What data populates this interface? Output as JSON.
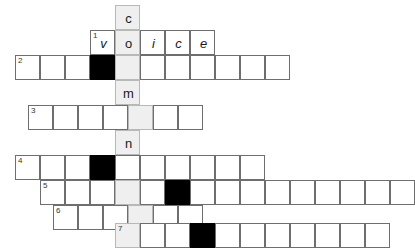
{
  "puzzle": {
    "type": "crossword",
    "cell_size": 25,
    "origin": {
      "x": 15,
      "y": 5
    },
    "colors": {
      "cell_background": "#ffffff",
      "cell_border": "#6e6e6e",
      "shaded_background": "#efefef",
      "shaded_border": "#b8b8b8",
      "block_background": "#000000",
      "letter_color": "#1a1a1a",
      "number_color": "#333333",
      "page_background": "#ffffff"
    },
    "vertical_word": {
      "column_x": 115,
      "letters": [
        "c",
        "o",
        "i",
        "m",
        "n",
        "i"
      ],
      "solved_text": "coimni"
    },
    "rows": [
      {
        "row_index": 0,
        "y": 5,
        "start_x": 115,
        "cells": [
          {
            "letter": "c",
            "shaded": true,
            "black": false,
            "number": ""
          }
        ]
      },
      {
        "row_index": 1,
        "y": 30,
        "start_x": 90,
        "cells": [
          {
            "letter": "v",
            "shaded": false,
            "black": false,
            "number": "1"
          },
          {
            "letter": "o",
            "shaded": true,
            "black": false,
            "number": ""
          },
          {
            "letter": "i",
            "shaded": false,
            "black": false,
            "number": ""
          },
          {
            "letter": "c",
            "shaded": false,
            "black": false,
            "number": ""
          },
          {
            "letter": "e",
            "shaded": false,
            "black": false,
            "number": ""
          }
        ]
      },
      {
        "row_index": 2,
        "y": 55,
        "start_x": 15,
        "cells": [
          {
            "letter": "",
            "shaded": false,
            "black": false,
            "number": "2"
          },
          {
            "letter": "",
            "shaded": false,
            "black": false,
            "number": ""
          },
          {
            "letter": "",
            "shaded": false,
            "black": false,
            "number": ""
          },
          {
            "letter": "",
            "shaded": false,
            "black": true,
            "number": ""
          },
          {
            "letter": "",
            "shaded": true,
            "black": false,
            "number": ""
          },
          {
            "letter": "",
            "shaded": false,
            "black": false,
            "number": ""
          },
          {
            "letter": "",
            "shaded": false,
            "black": false,
            "number": ""
          },
          {
            "letter": "",
            "shaded": false,
            "black": false,
            "number": ""
          },
          {
            "letter": "",
            "shaded": false,
            "black": false,
            "number": ""
          },
          {
            "letter": "",
            "shaded": false,
            "black": false,
            "number": ""
          },
          {
            "letter": "",
            "shaded": false,
            "black": false,
            "number": ""
          }
        ]
      },
      {
        "row_index": 3,
        "y": 80,
        "start_x": 115,
        "cells": [
          {
            "letter": "m",
            "shaded": true,
            "black": false,
            "number": ""
          }
        ]
      },
      {
        "row_index": 4,
        "y": 105,
        "start_x": 28,
        "cells": [
          {
            "letter": "",
            "shaded": false,
            "black": false,
            "number": "3"
          },
          {
            "letter": "",
            "shaded": false,
            "black": false,
            "number": ""
          },
          {
            "letter": "",
            "shaded": false,
            "black": false,
            "number": ""
          },
          {
            "letter": "",
            "shaded": false,
            "black": false,
            "number": ""
          },
          {
            "letter": "",
            "shaded": true,
            "black": false,
            "number": ""
          },
          {
            "letter": "",
            "shaded": false,
            "black": false,
            "number": ""
          },
          {
            "letter": "",
            "shaded": false,
            "black": false,
            "number": ""
          }
        ]
      },
      {
        "row_index": 5,
        "y": 130,
        "start_x": 115,
        "cells": [
          {
            "letter": "n",
            "shaded": true,
            "black": false,
            "number": ""
          }
        ]
      },
      {
        "row_index": 6,
        "y": 155,
        "start_x": 115,
        "cells": [
          {
            "letter": "i",
            "shaded": true,
            "black": false,
            "number": ""
          }
        ]
      },
      {
        "row_index": 7,
        "y": 155,
        "start_x": 15,
        "cells": [
          {
            "letter": "",
            "shaded": false,
            "black": false,
            "number": "4"
          },
          {
            "letter": "",
            "shaded": false,
            "black": false,
            "number": ""
          },
          {
            "letter": "",
            "shaded": false,
            "black": false,
            "number": ""
          },
          {
            "letter": "",
            "shaded": false,
            "black": true,
            "number": ""
          },
          {
            "letter": "",
            "shaded": false,
            "black": false,
            "number": "SKIP"
          },
          {
            "letter": "",
            "shaded": false,
            "black": false,
            "number": ""
          },
          {
            "letter": "",
            "shaded": false,
            "black": false,
            "number": ""
          },
          {
            "letter": "",
            "shaded": false,
            "black": false,
            "number": ""
          },
          {
            "letter": "",
            "shaded": false,
            "black": false,
            "number": ""
          },
          {
            "letter": "",
            "shaded": false,
            "black": false,
            "number": ""
          }
        ]
      },
      {
        "row_index": 8,
        "y": 180,
        "start_x": 40,
        "cells": [
          {
            "letter": "",
            "shaded": false,
            "black": false,
            "number": "5"
          },
          {
            "letter": "",
            "shaded": false,
            "black": false,
            "number": ""
          },
          {
            "letter": "",
            "shaded": false,
            "black": false,
            "number": ""
          },
          {
            "letter": "",
            "shaded": true,
            "black": false,
            "number": ""
          },
          {
            "letter": "",
            "shaded": false,
            "black": false,
            "number": ""
          },
          {
            "letter": "",
            "shaded": false,
            "black": true,
            "number": ""
          },
          {
            "letter": "",
            "shaded": false,
            "black": false,
            "number": ""
          },
          {
            "letter": "",
            "shaded": false,
            "black": false,
            "number": ""
          },
          {
            "letter": "",
            "shaded": false,
            "black": false,
            "number": ""
          },
          {
            "letter": "",
            "shaded": false,
            "black": false,
            "number": ""
          },
          {
            "letter": "",
            "shaded": false,
            "black": false,
            "number": ""
          },
          {
            "letter": "",
            "shaded": false,
            "black": false,
            "number": ""
          },
          {
            "letter": "",
            "shaded": false,
            "black": false,
            "number": ""
          },
          {
            "letter": "",
            "shaded": false,
            "black": false,
            "number": ""
          },
          {
            "letter": "",
            "shaded": false,
            "black": false,
            "number": ""
          }
        ]
      },
      {
        "row_index": 9,
        "y": 205,
        "start_x": 53,
        "cells": [
          {
            "letter": "",
            "shaded": false,
            "black": false,
            "number": "6"
          },
          {
            "letter": "",
            "shaded": false,
            "black": false,
            "number": ""
          },
          {
            "letter": "",
            "shaded": false,
            "black": false,
            "number": ""
          },
          {
            "letter": "",
            "shaded": true,
            "black": false,
            "number": ""
          },
          {
            "letter": "",
            "shaded": false,
            "black": false,
            "number": ""
          },
          {
            "letter": "",
            "shaded": false,
            "black": false,
            "number": ""
          }
        ]
      },
      {
        "row_index": 10,
        "y": 223,
        "start_x": 115,
        "cells": [
          {
            "letter": "",
            "shaded": true,
            "black": false,
            "number": "7"
          },
          {
            "letter": "",
            "shaded": false,
            "black": false,
            "number": ""
          },
          {
            "letter": "",
            "shaded": false,
            "black": false,
            "number": ""
          },
          {
            "letter": "",
            "shaded": false,
            "black": true,
            "number": ""
          },
          {
            "letter": "",
            "shaded": false,
            "black": false,
            "number": ""
          },
          {
            "letter": "",
            "shaded": false,
            "black": false,
            "number": ""
          },
          {
            "letter": "",
            "shaded": false,
            "black": false,
            "number": ""
          },
          {
            "letter": "",
            "shaded": false,
            "black": false,
            "number": ""
          },
          {
            "letter": "",
            "shaded": false,
            "black": false,
            "number": ""
          },
          {
            "letter": "",
            "shaded": false,
            "black": false,
            "number": ""
          },
          {
            "letter": "",
            "shaded": false,
            "black": false,
            "number": ""
          }
        ]
      }
    ]
  }
}
